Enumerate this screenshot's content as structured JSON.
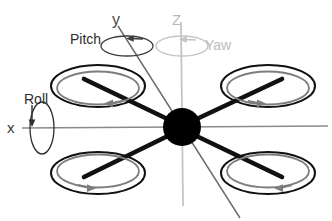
{
  "diagram": {
    "background_color": "#ffffff"
  },
  "axes": [
    {
      "id": "x",
      "label": "x",
      "color": "#808080",
      "orientation": "horizontal",
      "rotation_name": "Roll"
    },
    {
      "id": "y",
      "label": "y",
      "color": "#5a5a5a",
      "orientation": "diagonal",
      "rotation_name": "Pitch"
    },
    {
      "id": "z",
      "label": "z",
      "label_display": "z",
      "color": "#c0c0c0",
      "orientation": "vertical",
      "rotation_name": "Yaw"
    }
  ],
  "rotation_labels": {
    "roll": "Roll",
    "pitch": "Pitch",
    "yaw": "Yaw"
  },
  "axis_labels": {
    "x": "x",
    "y": "y",
    "z": "Z"
  },
  "body": {
    "hub_color": "#000000",
    "arm_color": "#111111",
    "hub_cx": 182,
    "hub_cy": 127,
    "hub_r": 19
  },
  "rotors": [
    {
      "id": "rotor-top-left",
      "cx": 98,
      "cy": 86,
      "rx": 47,
      "ry": 21,
      "spin": "counter-clockwise",
      "arrow": "left"
    },
    {
      "id": "rotor-top-right",
      "cx": 268,
      "cy": 86,
      "rx": 47,
      "ry": 21,
      "spin": "clockwise",
      "arrow": "right"
    },
    {
      "id": "rotor-bottom-left",
      "cx": 98,
      "cy": 173,
      "rx": 47,
      "ry": 21,
      "spin": "clockwise",
      "arrow": "right"
    },
    {
      "id": "rotor-bottom-right",
      "cx": 268,
      "cy": 173,
      "rx": 47,
      "ry": 21,
      "spin": "counter-clockwise",
      "arrow": "left"
    }
  ],
  "colors": {
    "rotor_outer": "#111111",
    "rotor_inner": "#7d7d7d",
    "axis_x": "#8a8a8a",
    "axis_y": "#6a6a6a",
    "axis_z": "#c4c4c4",
    "text_dark": "#2e2e2e",
    "text_light": "#bcbcbc"
  }
}
